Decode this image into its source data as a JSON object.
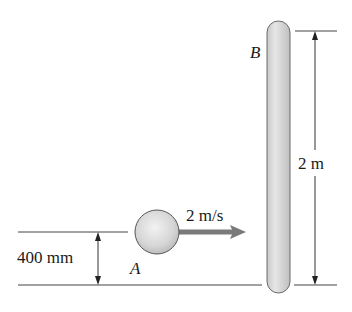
{
  "diagram": {
    "ball": {
      "label": "A",
      "velocity_label": "2 m/s",
      "height_label": "400 mm"
    },
    "rod": {
      "label": "B",
      "length_label": "2 m"
    },
    "colors": {
      "line": "#333333",
      "ball_fill": "#d9d9d9",
      "rod_fill": "#d4d4d4",
      "arrow": "#7a7a7a"
    }
  }
}
